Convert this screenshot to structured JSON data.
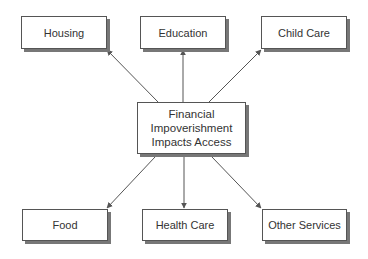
{
  "diagram": {
    "center": {
      "lines": [
        "Financial",
        "Impoverishment",
        "Impacts Access"
      ]
    },
    "nodes": [
      {
        "id": "housing",
        "label": "Housing"
      },
      {
        "id": "education",
        "label": "Education"
      },
      {
        "id": "childcare",
        "label": "Child Care"
      },
      {
        "id": "food",
        "label": "Food"
      },
      {
        "id": "health",
        "label": "Health Care"
      },
      {
        "id": "other",
        "label": "Other Services"
      }
    ],
    "edges": [
      {
        "from": "center",
        "to": "housing"
      },
      {
        "from": "center",
        "to": "education"
      },
      {
        "from": "center",
        "to": "childcare"
      },
      {
        "from": "center",
        "to": "food"
      },
      {
        "from": "center",
        "to": "health"
      },
      {
        "from": "center",
        "to": "other"
      }
    ],
    "colors": {
      "stroke": "#555555",
      "shadow": "#777777",
      "text": "#333333"
    }
  }
}
